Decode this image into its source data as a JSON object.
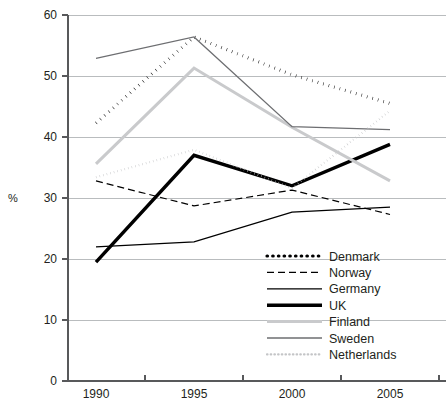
{
  "chart_data": {
    "type": "line",
    "title": "",
    "subtitle": "",
    "xlabel": "",
    "ylabel": "%",
    "x": [
      1990,
      1995,
      2000,
      2005
    ],
    "categories": [
      "1990",
      "1995",
      "2000",
      "2005"
    ],
    "xtick_labels": [
      "1990",
      "1995",
      "2000",
      "2005"
    ],
    "ytick_labels": [
      "0",
      "10",
      "20",
      "30",
      "40",
      "50",
      "60"
    ],
    "yticks": [
      0,
      10,
      20,
      30,
      40,
      50,
      60
    ],
    "ylim": [
      0,
      60
    ],
    "xlim": [
      1988.5,
      2007
    ],
    "grid": "horizontal",
    "legend_position": "inside-lower-right",
    "series": [
      {
        "name": "Denmark",
        "values": [
          42.3,
          56.4,
          50.2,
          45.5
        ],
        "style": "dotted",
        "color": "#000000",
        "width": 3.2,
        "dash": "0.5 5.2"
      },
      {
        "name": "Norway",
        "values": [
          32.8,
          28.7,
          31.3,
          27.3
        ],
        "style": "dashed",
        "color": "#000000",
        "width": 1.2,
        "dash": "7 4"
      },
      {
        "name": "Germany",
        "values": [
          22.0,
          22.8,
          27.7,
          28.5
        ],
        "style": "solid",
        "color": "#000000",
        "width": 1.3,
        "dash": "none"
      },
      {
        "name": "UK",
        "values": [
          19.5,
          37.0,
          32.0,
          38.8
        ],
        "style": "solid",
        "color": "#000000",
        "width": 3.4,
        "dash": "none"
      },
      {
        "name": "Finland",
        "values": [
          35.6,
          51.3,
          41.6,
          32.8
        ],
        "style": "solid",
        "color": "#c9cacc",
        "width": 3.0,
        "dash": "none"
      },
      {
        "name": "Sweden",
        "values": [
          52.9,
          56.4,
          41.7,
          41.2
        ],
        "style": "solid",
        "color": "#6d6e71",
        "width": 1.3,
        "dash": "none"
      },
      {
        "name": "Netherlands",
        "values": [
          33.4,
          37.9,
          31.6,
          44.3
        ],
        "style": "dotted",
        "color": "#c4c5c7",
        "width": 2.2,
        "dash": "0.5 3.2"
      }
    ]
  },
  "legend": {
    "items": [
      {
        "label": "Denmark"
      },
      {
        "label": "Norway"
      },
      {
        "label": "Germany"
      },
      {
        "label": "UK"
      },
      {
        "label": "Finland"
      },
      {
        "label": "Sweden"
      },
      {
        "label": "Netherlands"
      }
    ]
  },
  "axes": {
    "y_title": "%",
    "y_ticks": [
      "60",
      "50",
      "40",
      "30",
      "20",
      "10",
      "0"
    ],
    "x_ticks": [
      "1990",
      "1995",
      "2000",
      "2005"
    ]
  },
  "colors": {
    "grid": "#b9bcbe",
    "axis": "#58595b",
    "text": "#231f20",
    "light_gray": "#c9cacc",
    "mid_gray": "#6d6e71",
    "black": "#000000",
    "background": "#ffffff"
  }
}
